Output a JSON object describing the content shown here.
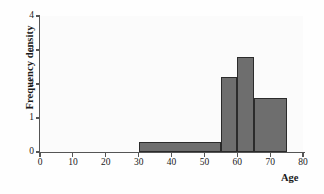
{
  "chart_data": {
    "type": "bar",
    "title": "",
    "subtitle": "",
    "xlabel": "Age",
    "ylabel": "Frequency density",
    "xlim": [
      0,
      80
    ],
    "ylim": [
      0,
      4
    ],
    "xticks": [
      0,
      10,
      20,
      30,
      40,
      50,
      60,
      70,
      80
    ],
    "yticks": [
      0,
      1,
      2,
      3,
      4
    ],
    "xtick_labels": [
      "0",
      "10",
      "20",
      "30",
      "40",
      "50",
      "60",
      "70",
      "80"
    ],
    "ytick_labels": [
      "0",
      "1",
      "2",
      "3",
      "4"
    ],
    "grid": false,
    "legend": null,
    "annotations": [],
    "bar_fill_color": "#6e6e6e",
    "bar_edge_color": "#2b2b2b",
    "axis_color": "#555555",
    "background_color": "#fbfbfb",
    "histogram": true,
    "bin_edges": [
      30,
      55,
      60,
      65,
      75
    ],
    "bin_labels": [
      "30-55",
      "55-60",
      "60-65",
      "65-75"
    ],
    "values": [
      0.3,
      2.2,
      2.8,
      1.6
    ],
    "bars": [
      {
        "x_start": 30,
        "x_end": 55,
        "width": 25,
        "density": 0.3
      },
      {
        "x_start": 55,
        "x_end": 60,
        "width": 5,
        "density": 2.2
      },
      {
        "x_start": 60,
        "x_end": 65,
        "width": 5,
        "density": 2.8
      },
      {
        "x_start": 65,
        "x_end": 75,
        "width": 10,
        "density": 1.6
      }
    ]
  }
}
